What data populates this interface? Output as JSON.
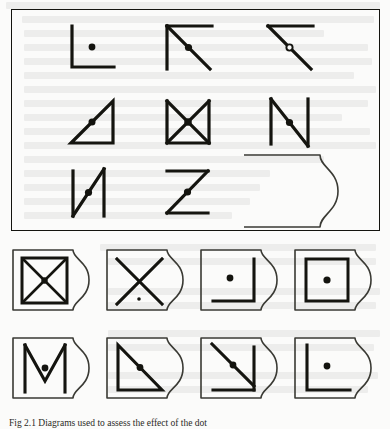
{
  "figure": {
    "caption": "Fig 2.1 Diagrams used to assess the effect of the dot",
    "line_color": "#14140f",
    "panel_border_color": "#14140f",
    "background_color": "#fbfbfa",
    "top_panel": {
      "name": "stimulus-panel",
      "rows": [
        {
          "items": [
            {
              "id": "s1",
              "label": "corner-left-down-with-dot",
              "marker": "filled-dot",
              "marker_position": "interior-center"
            },
            {
              "id": "s2",
              "label": "corner-top-left-with-diagonal",
              "marker": "filled-dot",
              "marker_position": "diagonal-midpoint"
            },
            {
              "id": "s3",
              "label": "top-line-with-diagonal",
              "marker": "open-circle",
              "marker_position": "diagonal-midpoint"
            }
          ]
        },
        {
          "items": [
            {
              "id": "s4",
              "label": "right-triangle",
              "marker": "filled-dot",
              "marker_position": "hypotenuse-midpoint"
            },
            {
              "id": "s5",
              "label": "bowtie-triangles",
              "marker": "filled-dot",
              "marker_position": "crossing-point"
            },
            {
              "id": "s6",
              "label": "letter-n",
              "marker": "filled-dot",
              "marker_position": "diagonal-midpoint"
            }
          ]
        },
        {
          "items": [
            {
              "id": "s7",
              "label": "letter-n-narrow",
              "marker": "filled-dot",
              "marker_position": "diagonal-midpoint"
            },
            {
              "id": "s8",
              "label": "letter-z",
              "marker": "filled-dot",
              "marker_position": "diagonal-midpoint"
            },
            {
              "id": "s9",
              "label": "blank-response-card",
              "marker": "none",
              "marker_position": "none"
            }
          ]
        }
      ]
    },
    "card_grid": {
      "name": "response-card-grid",
      "columns": 4,
      "rows": 2,
      "cards": [
        {
          "id": "c1",
          "label": "square-with-x",
          "marker": "filled-dot",
          "marker_position": "center"
        },
        {
          "id": "c2",
          "label": "x-cross",
          "marker": "small-dot",
          "marker_position": "below-center"
        },
        {
          "id": "c3",
          "label": "mirrored-corner",
          "marker": "filled-dot",
          "marker_position": "interior-center"
        },
        {
          "id": "c4",
          "label": "square-outline",
          "marker": "filled-dot",
          "marker_position": "center"
        },
        {
          "id": "c5",
          "label": "letter-m",
          "marker": "filled-dot",
          "marker_position": "vertex-center"
        },
        {
          "id": "c6",
          "label": "right-triangle-mirrored",
          "marker": "filled-dot",
          "marker_position": "hypotenuse-midpoint"
        },
        {
          "id": "c7",
          "label": "arrow-corner-diagonal",
          "marker": "filled-dot",
          "marker_position": "diagonal-midpoint"
        },
        {
          "id": "c8",
          "label": "corner-left-down",
          "marker": "filled-dot",
          "marker_position": "interior-center"
        }
      ]
    }
  }
}
